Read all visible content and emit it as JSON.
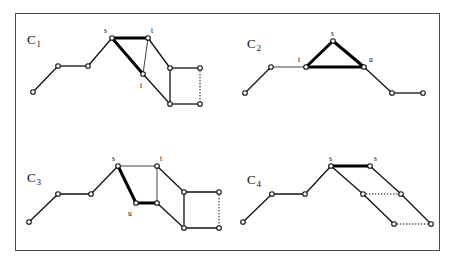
{
  "figure": {
    "border_color": "#4a4a4a",
    "background": "#ffffff",
    "edge_color": "#111111",
    "highlight_color": "#000000",
    "vertex_fill": "#ffffff",
    "vertex_stroke": "#111111"
  },
  "panels": [
    {
      "id": "c1",
      "name": "C",
      "subscript": "1",
      "label_x": 27,
      "label_y": 32,
      "vertices": [
        {
          "id": "a",
          "x": 33,
          "y": 92
        },
        {
          "id": "b",
          "x": 58,
          "y": 66
        },
        {
          "id": "c",
          "x": 88,
          "y": 66
        },
        {
          "id": "s",
          "x": 112,
          "y": 38
        },
        {
          "id": "t_top",
          "x": 148,
          "y": 38
        },
        {
          "id": "t_mid",
          "x": 143,
          "y": 74
        },
        {
          "id": "p",
          "x": 170,
          "y": 68
        },
        {
          "id": "q",
          "x": 200,
          "y": 68
        },
        {
          "id": "r",
          "x": 170,
          "y": 104
        },
        {
          "id": "w",
          "x": 200,
          "y": 104
        }
      ],
      "edges": [
        {
          "from": "a",
          "to": "b",
          "style": "solid"
        },
        {
          "from": "b",
          "to": "c",
          "style": "solid"
        },
        {
          "from": "c",
          "to": "s",
          "style": "solid"
        },
        {
          "from": "s",
          "to": "t_top",
          "style": "thick"
        },
        {
          "from": "s",
          "to": "t_mid",
          "style": "thick"
        },
        {
          "from": "t_top",
          "to": "t_mid",
          "style": "thin"
        },
        {
          "from": "t_top",
          "to": "p",
          "style": "solid"
        },
        {
          "from": "t_mid",
          "to": "r",
          "style": "solid"
        },
        {
          "from": "p",
          "to": "q",
          "style": "solid"
        },
        {
          "from": "p",
          "to": "r",
          "style": "solid"
        },
        {
          "from": "r",
          "to": "w",
          "style": "solid"
        },
        {
          "from": "q",
          "to": "w",
          "style": "dotted"
        }
      ],
      "vertex_labels": [
        {
          "text": "s",
          "x": 104,
          "y": 27
        },
        {
          "text": "t",
          "x": 151,
          "y": 27
        },
        {
          "text": "t",
          "x": 140,
          "y": 82
        }
      ]
    },
    {
      "id": "c2",
      "name": "C",
      "subscript": "2",
      "label_x": 247,
      "label_y": 36,
      "vertices": [
        {
          "id": "a",
          "x": 245,
          "y": 93
        },
        {
          "id": "b",
          "x": 271,
          "y": 67
        },
        {
          "id": "t",
          "x": 306,
          "y": 67
        },
        {
          "id": "s",
          "x": 333,
          "y": 41
        },
        {
          "id": "u",
          "x": 364,
          "y": 67
        },
        {
          "id": "e",
          "x": 392,
          "y": 93
        },
        {
          "id": "f",
          "x": 423,
          "y": 93
        }
      ],
      "edges": [
        {
          "from": "a",
          "to": "b",
          "style": "solid"
        },
        {
          "from": "b",
          "to": "t",
          "style": "thin"
        },
        {
          "from": "t",
          "to": "s",
          "style": "thick"
        },
        {
          "from": "s",
          "to": "u",
          "style": "thick"
        },
        {
          "from": "t",
          "to": "u",
          "style": "thick"
        },
        {
          "from": "u",
          "to": "e",
          "style": "solid"
        },
        {
          "from": "e",
          "to": "f",
          "style": "solid"
        }
      ],
      "vertex_labels": [
        {
          "text": "s",
          "x": 331,
          "y": 30
        },
        {
          "text": "t",
          "x": 298,
          "y": 56
        },
        {
          "text": "u",
          "x": 369,
          "y": 56
        }
      ]
    },
    {
      "id": "c3",
      "name": "C",
      "subscript": "3",
      "label_x": 27,
      "label_y": 170,
      "vertices": [
        {
          "id": "a",
          "x": 29,
          "y": 222
        },
        {
          "id": "b",
          "x": 58,
          "y": 194
        },
        {
          "id": "c",
          "x": 91,
          "y": 194
        },
        {
          "id": "s",
          "x": 118,
          "y": 166
        },
        {
          "id": "t",
          "x": 157,
          "y": 166
        },
        {
          "id": "u",
          "x": 136,
          "y": 203
        },
        {
          "id": "v",
          "x": 157,
          "y": 203
        },
        {
          "id": "p",
          "x": 184,
          "y": 192
        },
        {
          "id": "q",
          "x": 219,
          "y": 192
        },
        {
          "id": "r",
          "x": 184,
          "y": 228
        },
        {
          "id": "w",
          "x": 219,
          "y": 228
        }
      ],
      "edges": [
        {
          "from": "a",
          "to": "b",
          "style": "solid"
        },
        {
          "from": "b",
          "to": "c",
          "style": "solid"
        },
        {
          "from": "c",
          "to": "s",
          "style": "solid"
        },
        {
          "from": "s",
          "to": "t",
          "style": "thin"
        },
        {
          "from": "s",
          "to": "u",
          "style": "thick"
        },
        {
          "from": "u",
          "to": "v",
          "style": "thick"
        },
        {
          "from": "t",
          "to": "v",
          "style": "thin"
        },
        {
          "from": "t",
          "to": "p",
          "style": "solid"
        },
        {
          "from": "v",
          "to": "r",
          "style": "solid"
        },
        {
          "from": "p",
          "to": "q",
          "style": "solid"
        },
        {
          "from": "p",
          "to": "r",
          "style": "solid"
        },
        {
          "from": "r",
          "to": "w",
          "style": "solid"
        },
        {
          "from": "q",
          "to": "w",
          "style": "dotted"
        }
      ],
      "vertex_labels": [
        {
          "text": "s",
          "x": 112,
          "y": 155
        },
        {
          "text": "t",
          "x": 160,
          "y": 155
        },
        {
          "text": "u",
          "x": 128,
          "y": 210
        }
      ]
    },
    {
      "id": "c4",
      "name": "C",
      "subscript": "4",
      "label_x": 247,
      "label_y": 172,
      "vertices": [
        {
          "id": "a",
          "x": 243,
          "y": 222
        },
        {
          "id": "b",
          "x": 272,
          "y": 194
        },
        {
          "id": "c",
          "x": 305,
          "y": 194
        },
        {
          "id": "s1",
          "x": 331,
          "y": 166
        },
        {
          "id": "s2",
          "x": 370,
          "y": 166
        },
        {
          "id": "m1",
          "x": 363,
          "y": 194
        },
        {
          "id": "m2",
          "x": 401,
          "y": 194
        },
        {
          "id": "n1",
          "x": 394,
          "y": 224
        },
        {
          "id": "n2",
          "x": 431,
          "y": 224
        }
      ],
      "edges": [
        {
          "from": "a",
          "to": "b",
          "style": "solid"
        },
        {
          "from": "b",
          "to": "c",
          "style": "solid"
        },
        {
          "from": "c",
          "to": "s1",
          "style": "solid"
        },
        {
          "from": "s1",
          "to": "s2",
          "style": "thick"
        },
        {
          "from": "s1",
          "to": "m1",
          "style": "solid"
        },
        {
          "from": "s2",
          "to": "m2",
          "style": "solid"
        },
        {
          "from": "m1",
          "to": "m2",
          "style": "dotted"
        },
        {
          "from": "m1",
          "to": "n1",
          "style": "solid"
        },
        {
          "from": "m2",
          "to": "n2",
          "style": "solid"
        },
        {
          "from": "n1",
          "to": "n2",
          "style": "dotted"
        }
      ],
      "vertex_labels": [
        {
          "text": "s",
          "x": 329,
          "y": 155
        },
        {
          "text": "s",
          "x": 374,
          "y": 155
        }
      ]
    }
  ]
}
